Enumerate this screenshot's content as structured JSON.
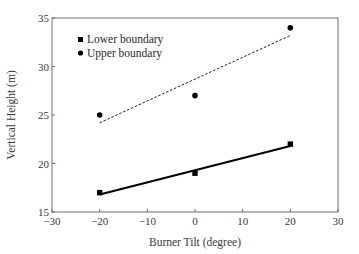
{
  "chart_data": {
    "type": "scatter",
    "title": "",
    "xlabel": "Burner Tilt (degree)",
    "ylabel": "Vertical Height (m)",
    "xlim": [
      -30,
      30
    ],
    "ylim": [
      15,
      35
    ],
    "xticks": [
      -30,
      -20,
      -10,
      0,
      10,
      20,
      30
    ],
    "xtick_labels": [
      "−30",
      "−20",
      "−10",
      "0",
      "10",
      "20",
      "30"
    ],
    "yticks": [
      15,
      20,
      25,
      30,
      35
    ],
    "ytick_labels": [
      "15",
      "20",
      "25",
      "30",
      "35"
    ],
    "grid": false,
    "legend_position": "upper left",
    "series": [
      {
        "name": "Lower boundary",
        "marker": "square",
        "x": [
          -20,
          0,
          20
        ],
        "values": [
          17,
          19,
          22
        ],
        "trendline": {
          "style": "solid",
          "x": [
            -20,
            20
          ],
          "y": [
            16.8,
            21.8
          ]
        }
      },
      {
        "name": "Upper boundary",
        "marker": "circle",
        "x": [
          -20,
          0,
          20
        ],
        "values": [
          25,
          27,
          34
        ],
        "trendline": {
          "style": "dashed",
          "x": [
            -20,
            20
          ],
          "y": [
            24.2,
            33.2
          ]
        }
      }
    ]
  },
  "legend": {
    "items": [
      {
        "label": "Lower boundary",
        "marker": "square"
      },
      {
        "label": "Upper boundary",
        "marker": "circle"
      }
    ]
  },
  "colors": {
    "axis": "#6e6e6e",
    "marker": "#000000",
    "text": "#3a3a3a"
  }
}
